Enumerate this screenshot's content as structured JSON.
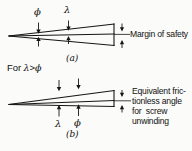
{
  "figure": {
    "title_sym_phi": "ϕ",
    "title_sym_lambda": "λ",
    "condition_prefix": "For ",
    "condition_lambda": "λ",
    "condition_rel": ">",
    "condition_phi": "ϕ",
    "diagram_a": {
      "caption": "(a)",
      "label_top_phi": "ϕ",
      "label_top_lambda": "λ",
      "annotation": "Margin of safety"
    },
    "diagram_b": {
      "caption": "(b)",
      "label_top_phi": "ϕ",
      "label_top_lambda": "λ",
      "label_bottom_lambda": "λ",
      "label_bottom_phi": "ϕ",
      "annotation_line1": "Equivalent fric-",
      "annotation_line2": "tionless angle",
      "annotation_line3": "for  screw",
      "annotation_line4": "unwinding"
    },
    "colors": {
      "ink": "#141414",
      "paper": "#fbfbf9"
    }
  }
}
